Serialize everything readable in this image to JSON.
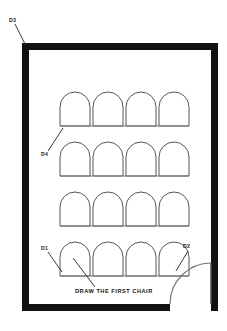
{
  "drawing": {
    "title": "Seating layout floor plan",
    "caption": "DRAW THE FIRST CHAIR",
    "background_color": "#ffffff",
    "wall_color": "#111111",
    "chair_outline_color": "#555555",
    "leader_color": "#3a3a3a"
  },
  "labels": {
    "d1": "D1",
    "d2": "D2",
    "d3": "D3",
    "d4": "D4"
  },
  "room": {
    "wall_thickness": 7,
    "outer": {
      "x": 22,
      "y": 43,
      "width": 196,
      "height": 268
    },
    "door_opening": {
      "start_x": 170,
      "end_x": 211
    }
  },
  "seating": {
    "rows": 4,
    "columns": 4,
    "chair_width": 30,
    "chair_height": 34,
    "chair_gap": 3,
    "first_chair_x": 60,
    "row_y": [
      92,
      142,
      192,
      242
    ],
    "row_names": [
      "row-1",
      "row-2",
      "row-3",
      "row-4"
    ]
  },
  "annotations": [
    {
      "name": "d3-leader",
      "label": "D3",
      "text_x": 9,
      "text_y": 22,
      "line": [
        15,
        24,
        25,
        44
      ]
    },
    {
      "name": "d4-leader",
      "label": "D4",
      "text_x": 41,
      "text_y": 156,
      "line": [
        48,
        151,
        63,
        128
      ]
    },
    {
      "name": "d1-leader",
      "label": "D1",
      "text_x": 41,
      "text_y": 250,
      "line": [
        48,
        252,
        62,
        272
      ]
    },
    {
      "name": "d2-leader",
      "label": "D2",
      "text_x": 183,
      "text_y": 248,
      "line": [
        188,
        251,
        176,
        271
      ]
    },
    {
      "name": "caption-leader",
      "label": "DRAW THE FIRST CHAIR",
      "text_x": 75,
      "text_y": 293,
      "line": [
        95,
        287,
        73,
        258
      ]
    }
  ]
}
